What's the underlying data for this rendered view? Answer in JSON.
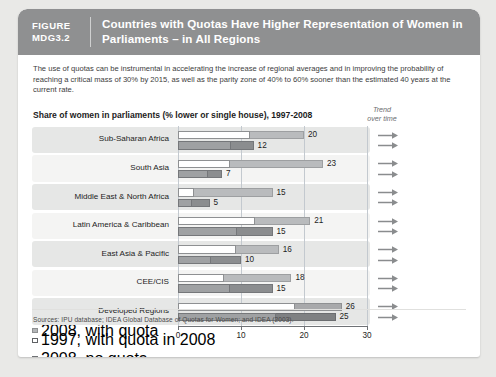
{
  "header": {
    "tag_line1": "FIGURE",
    "tag_line2": "MDG3.2",
    "title": "Countries with Quotas Have Higher Representation of Women in Parliaments – in All Regions"
  },
  "intro": "The use of quotas can be instrumental in accelerating the increase of regional averages and in improving the probability of reaching a critical mass of 30% by 2015, as well as the parity zone of 40% to 60% sooner than the estimated 40 years at the current rate.",
  "chart_title": "Share of women in parliaments (% lower or single house), 1997-2008",
  "trend_label_line1": "Trend",
  "trend_label_line2": "over time",
  "legend": [
    {
      "swatch": "filled-square",
      "label": "2008, with quota"
    },
    {
      "swatch": "hollow-square",
      "label": "1997, with quota in 2008"
    },
    {
      "swatch": "filled-square",
      "label": "2008, no quota"
    },
    {
      "swatch": "hollow-square",
      "label": "1997, no quota in 2008"
    }
  ],
  "sources": "Sources: IPU database; IDEA Global Database of Quotas for Women; and IDEA (2003).",
  "colors": {
    "header_band": "#8f9091",
    "series_2008": "#b9bbbd",
    "series_1997": "#8b8d8f",
    "row_band": "#e6e7e6",
    "row_band_alt": "#f4f4f3",
    "gridline": "#c3c9cf",
    "axis": "#6f7276"
  },
  "chart_data": {
    "type": "bar",
    "title": "Share of women in parliaments (% lower or single house), 1997-2008",
    "xlabel": "",
    "ylabel": "",
    "xlim": [
      0,
      30
    ],
    "xticks": [
      0,
      10,
      20,
      30
    ],
    "grid": true,
    "orientation": "horizontal",
    "legend_position": "right",
    "categories": [
      "Sub-Saharan Africa",
      "South Asia",
      "Middle East & North Africa",
      "Latin America & Caribbean",
      "East Asia & Pacific",
      "CEE/CIS",
      "Developed Regions"
    ],
    "series": [
      {
        "name": "2008, with quota",
        "values": [
          20,
          23,
          15,
          21,
          16,
          18,
          26
        ]
      },
      {
        "name": "1997, with quota in 2008",
        "values": [
          11.5,
          8.2,
          2.5,
          12.3,
          9.2,
          7.3,
          18.5
        ]
      },
      {
        "name": "2008, no quota",
        "values": [
          12,
          7,
          5,
          15,
          10,
          15,
          25
        ]
      },
      {
        "name": "1997, no quota in 2008",
        "values": [
          8.4,
          4.7,
          2.2,
          9.4,
          5.2,
          8.2,
          15.5
        ]
      }
    ],
    "data_labels_2008": [
      20,
      23,
      15,
      21,
      16,
      18,
      26
    ],
    "data_labels_1997": [
      12,
      7,
      5,
      15,
      10,
      15,
      25
    ],
    "trend": [
      "increasing",
      "increasing",
      "increasing",
      "increasing",
      "increasing",
      "increasing",
      "increasing"
    ]
  }
}
